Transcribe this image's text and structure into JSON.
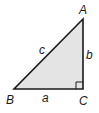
{
  "diagram": {
    "type": "right-triangle",
    "fill_color": "#e4e4e4",
    "stroke_color": "#1a1a1a",
    "vertices": {
      "A": {
        "label": "A",
        "x": 83,
        "y": 19
      },
      "B": {
        "label": "B",
        "x": 14,
        "y": 89
      },
      "C": {
        "label": "C",
        "x": 83,
        "y": 89
      }
    },
    "sides": {
      "a": {
        "label": "a",
        "between": "B-C"
      },
      "b": {
        "label": "b",
        "between": "A-C"
      },
      "c": {
        "label": "c",
        "between": "A-B"
      }
    },
    "right_angle_at": "C"
  }
}
